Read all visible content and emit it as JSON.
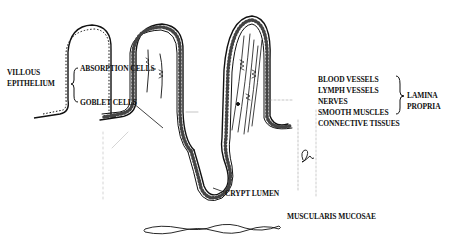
{
  "diagram": {
    "left_group": {
      "heading_lines": [
        "VILLOUS",
        "EPITHELIUM"
      ],
      "items": [
        "ABSORPTION CELLS",
        "GOBLET CELLS"
      ]
    },
    "right_group": {
      "items": [
        "BLOOD VESSELS",
        "LYMPH VESSELS",
        "NERVES",
        "SMOOTH MUSCLES",
        "CONNECTIVE TISSUES"
      ],
      "heading_lines": [
        "LAMINA",
        "PROPRIA"
      ]
    },
    "crypt_label": "CRYPT LUMEN",
    "muscularis_label": "MUSCULARIS MUCOSAE",
    "signature_glyph": "signature-mark",
    "colors": {
      "ink": "#111111",
      "background": "#ffffff"
    }
  }
}
